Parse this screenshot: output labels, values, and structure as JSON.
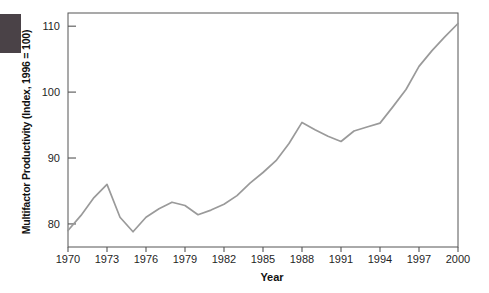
{
  "figure": {
    "corner_block_color": "#4a4247",
    "line_color": "#9a9a9a",
    "axis_color": "#555555",
    "background_color": "#ffffff"
  },
  "chart_data": {
    "type": "line",
    "title": "",
    "xlabel": "Year",
    "ylabel": "Multifactor Productivity (Index, 1996 = 100)",
    "legend": "none",
    "grid": false,
    "xlim": [
      1970,
      2000
    ],
    "ylim": [
      76.5,
      112
    ],
    "x_ticks": [
      1970,
      1973,
      1976,
      1979,
      1982,
      1985,
      1988,
      1991,
      1994,
      1997,
      2000
    ],
    "y_ticks": [
      80,
      90,
      100,
      110
    ],
    "x": [
      1970,
      1971,
      1972,
      1973,
      1974,
      1975,
      1976,
      1977,
      1978,
      1979,
      1980,
      1981,
      1982,
      1983,
      1984,
      1985,
      1986,
      1987,
      1988,
      1989,
      1990,
      1991,
      1992,
      1993,
      1994,
      1995,
      1996,
      1997,
      1998,
      1999,
      2000
    ],
    "values": [
      79.0,
      81.3,
      84.0,
      86.0,
      81.0,
      78.8,
      81.0,
      82.3,
      83.3,
      82.8,
      81.4,
      82.1,
      83.0,
      84.3,
      86.2,
      87.8,
      89.6,
      92.2,
      95.4,
      94.3,
      93.3,
      92.5,
      94.1,
      94.7,
      95.3,
      97.8,
      100.4,
      103.9,
      106.3,
      108.4,
      110.4
    ]
  }
}
